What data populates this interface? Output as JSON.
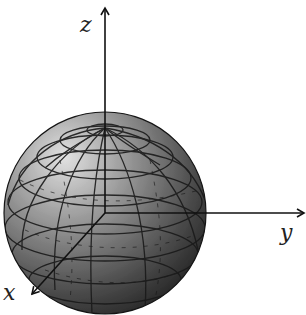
{
  "diagram": {
    "type": "3d-coordinate-system-with-sphere",
    "origin": {
      "x": 105,
      "y": 213
    },
    "sphere": {
      "cx": 105,
      "cy": 213,
      "r": 101,
      "colors": {
        "highlight": "#d8d8d8",
        "mid": "#7a7a7a",
        "shadow": "#2a2a2a",
        "grid": "#1a1a1a"
      },
      "latitude_lines": 7,
      "longitude_lines": 12
    },
    "axes": [
      {
        "name": "z",
        "label": "z",
        "to": {
          "x": 105,
          "y": 8
        }
      },
      {
        "name": "y",
        "label": "y",
        "to": {
          "x": 304,
          "y": 213
        }
      },
      {
        "name": "x",
        "label": "x",
        "to": {
          "x": 32,
          "y": 294
        }
      }
    ],
    "labels": {
      "z": "z",
      "y": "y",
      "x": "x"
    }
  }
}
